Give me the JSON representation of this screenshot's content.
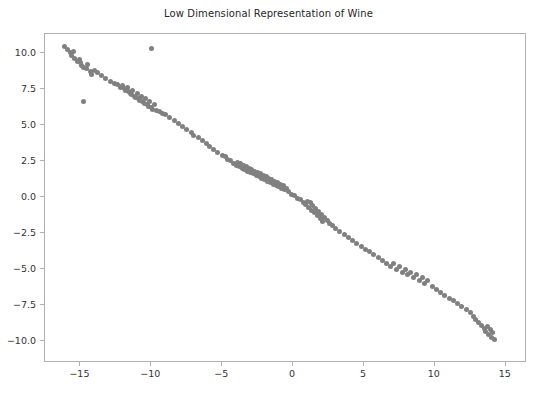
{
  "figure": {
    "width": 537,
    "height": 395,
    "background": "#ffffff"
  },
  "chart_data": {
    "type": "scatter",
    "title": "Low Dimensional Representation of Wine",
    "xlabel": "",
    "ylabel": "",
    "xlim": [
      -17.5,
      16.5
    ],
    "ylim": [
      -11.5,
      11.3
    ],
    "grid": false,
    "legend": null,
    "marker": {
      "color": "#808080",
      "size_px": 5,
      "shape": "circle",
      "alpha": 1.0
    },
    "axis": {
      "frame_color": "#b0b0b0",
      "tick_color": "#b0b0b0",
      "label_color": "#333333"
    },
    "xticks": [
      -15,
      -10,
      -5,
      0,
      5,
      10,
      15
    ],
    "xticklabels": [
      "−15",
      "−10",
      "−5",
      "0",
      "5",
      "10",
      "15"
    ],
    "yticks": [
      10.0,
      7.5,
      5.0,
      2.5,
      0.0,
      -2.5,
      -5.0,
      -7.5,
      -10.0
    ],
    "yticklabels": [
      "10.0",
      "7.5",
      "5.0",
      "2.5",
      "0.0",
      "−2.5",
      "−5.0",
      "−7.5",
      "−10.0"
    ],
    "n_points": 178,
    "x": [
      -16.1,
      -15.9,
      -15.7,
      -15.6,
      -15.4,
      -15.5,
      -15.2,
      -15.1,
      -15.0,
      -14.9,
      -14.8,
      -14.6,
      -14.5,
      -14.3,
      -14.2,
      -14.0,
      -13.8,
      -13.5,
      -13.2,
      -12.9,
      -12.6,
      -12.4,
      -12.2,
      -12.0,
      -11.9,
      -11.8,
      -11.7,
      -11.6,
      -11.5,
      -11.4,
      -11.3,
      -11.2,
      -11.1,
      -11.0,
      -10.9,
      -10.8,
      -10.7,
      -10.6,
      -10.5,
      -10.4,
      -10.3,
      -10.2,
      -10.1,
      -10.0,
      -9.9,
      -9.8,
      -9.6,
      -9.4,
      -9.2,
      -9.0,
      -8.7,
      -8.4,
      -8.1,
      -7.8,
      -7.5,
      -7.2,
      -7.0,
      -6.7,
      -6.4,
      -6.1,
      -5.9,
      -5.6,
      -5.3,
      -5.0,
      -4.8,
      -4.6,
      -4.4,
      -4.2,
      -4.0,
      -3.9,
      -3.8,
      -3.7,
      -3.6,
      -3.5,
      -3.4,
      -3.3,
      -3.2,
      -3.1,
      -3.0,
      -2.9,
      -2.8,
      -2.7,
      -2.6,
      -2.5,
      -2.4,
      -2.3,
      -2.2,
      -2.1,
      -2.0,
      -1.9,
      -1.8,
      -1.7,
      -1.6,
      -1.5,
      -1.4,
      -1.3,
      -1.2,
      -1.1,
      -1.0,
      -0.9,
      -0.8,
      -0.7,
      -0.6,
      -0.5,
      -0.3,
      -0.1,
      0.1,
      0.3,
      0.5,
      0.7,
      0.9,
      1.0,
      1.1,
      1.2,
      1.3,
      1.4,
      1.5,
      1.6,
      1.7,
      1.8,
      1.9,
      2.0,
      2.1,
      2.2,
      2.4,
      2.6,
      2.8,
      3.0,
      3.3,
      3.6,
      3.9,
      4.2,
      4.5,
      4.8,
      5.1,
      5.4,
      5.7,
      6.0,
      6.3,
      6.6,
      6.9,
      7.1,
      7.3,
      7.5,
      7.7,
      7.9,
      8.1,
      8.3,
      8.5,
      8.7,
      8.9,
      9.1,
      9.3,
      9.5,
      9.8,
      10.1,
      10.4,
      10.7,
      11.0,
      11.3,
      11.6,
      11.9,
      12.2,
      12.5,
      12.7,
      12.9,
      13.1,
      13.3,
      13.5,
      13.6,
      13.7,
      13.8,
      13.9,
      14.0,
      14.1,
      14.2,
      -14.8,
      -10.0
    ],
    "y": [
      10.4,
      10.2,
      10.0,
      9.8,
      9.6,
      10.1,
      9.4,
      9.5,
      9.3,
      9.1,
      9.0,
      8.9,
      9.2,
      8.7,
      8.5,
      8.8,
      8.6,
      8.4,
      8.2,
      8.0,
      7.9,
      7.8,
      7.6,
      7.7,
      7.5,
      7.4,
      7.6,
      7.3,
      7.2,
      7.1,
      7.4,
      7.0,
      6.9,
      7.2,
      6.8,
      6.7,
      7.0,
      6.6,
      6.5,
      6.8,
      6.4,
      6.3,
      6.6,
      6.2,
      6.1,
      6.4,
      6.0,
      5.9,
      5.8,
      5.7,
      5.5,
      5.3,
      5.1,
      4.9,
      4.7,
      4.5,
      4.3,
      4.1,
      3.9,
      3.7,
      3.5,
      3.3,
      3.1,
      2.9,
      2.8,
      2.6,
      2.5,
      2.3,
      2.2,
      2.4,
      2.1,
      2.3,
      2.0,
      2.2,
      1.9,
      2.1,
      1.8,
      2.0,
      1.7,
      1.9,
      1.6,
      1.8,
      1.5,
      1.7,
      1.4,
      1.6,
      1.3,
      1.5,
      1.2,
      1.4,
      1.1,
      1.3,
      1.0,
      1.2,
      0.9,
      1.1,
      0.8,
      1.0,
      0.7,
      0.9,
      0.6,
      0.8,
      0.5,
      0.6,
      0.4,
      0.2,
      0.1,
      -0.1,
      -0.2,
      -0.4,
      -0.5,
      -0.3,
      -0.7,
      -0.4,
      -0.9,
      -0.6,
      -1.1,
      -0.8,
      -1.3,
      -1.0,
      -1.5,
      -1.2,
      -1.7,
      -1.4,
      -1.6,
      -1.8,
      -2.0,
      -2.2,
      -2.4,
      -2.6,
      -2.8,
      -3.0,
      -3.2,
      -3.4,
      -3.6,
      -3.8,
      -4.0,
      -4.2,
      -4.4,
      -4.6,
      -4.8,
      -4.6,
      -5.0,
      -4.8,
      -5.2,
      -5.0,
      -5.4,
      -5.2,
      -5.6,
      -5.4,
      -5.8,
      -5.6,
      -6.0,
      -5.8,
      -6.2,
      -6.4,
      -6.6,
      -6.8,
      -7.0,
      -7.2,
      -7.4,
      -7.6,
      -7.8,
      -8.0,
      -8.3,
      -8.5,
      -8.7,
      -8.9,
      -9.1,
      -9.3,
      -9.0,
      -9.5,
      -9.2,
      -9.7,
      -9.4,
      -9.9,
      6.6,
      10.3
    ]
  }
}
